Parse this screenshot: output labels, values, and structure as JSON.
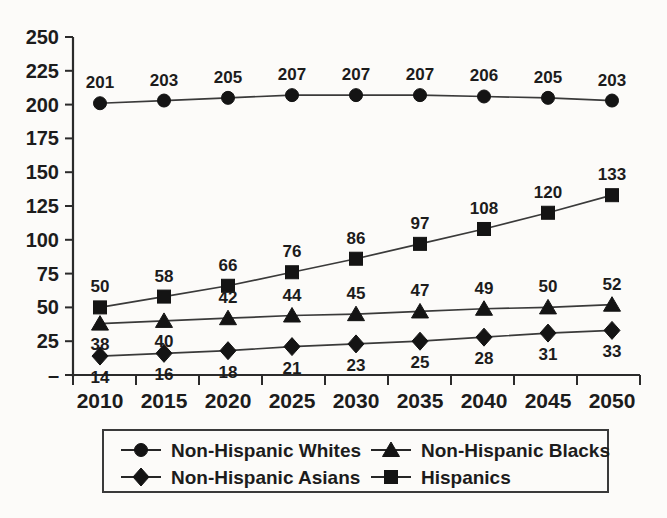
{
  "chart_data": {
    "type": "line",
    "title": "",
    "xlabel": "",
    "ylabel": "",
    "categories": [
      "2010",
      "2015",
      "2020",
      "2025",
      "2030",
      "2035",
      "2040",
      "2045",
      "2050"
    ],
    "ylim": [
      0,
      250
    ],
    "ytick_labels": [
      "–",
      "25",
      "50",
      "75",
      "100",
      "125",
      "150",
      "175",
      "200",
      "225",
      "250"
    ],
    "ytick_values": [
      0,
      25,
      50,
      75,
      100,
      125,
      150,
      175,
      200,
      225,
      250
    ],
    "grid": false,
    "legend_position": "bottom",
    "series": [
      {
        "name": "Non-Hispanic Whites",
        "marker": "circle",
        "values": [
          201,
          203,
          205,
          207,
          207,
          207,
          206,
          205,
          203
        ],
        "label_position": "above"
      },
      {
        "name": "Non-Hispanic Blacks",
        "marker": "triangle",
        "values": [
          38,
          40,
          42,
          44,
          45,
          47,
          49,
          50,
          52
        ],
        "label_position": "mixed"
      },
      {
        "name": "Non-Hispanic Asians",
        "marker": "diamond",
        "values": [
          14,
          16,
          18,
          21,
          23,
          25,
          28,
          31,
          33
        ],
        "label_position": "below"
      },
      {
        "name": "Hispanics",
        "marker": "square",
        "values": [
          50,
          58,
          66,
          76,
          86,
          97,
          108,
          120,
          133
        ],
        "label_position": "above"
      }
    ]
  },
  "legend": {
    "entries": [
      {
        "label": "Non-Hispanic Whites",
        "marker": "circle"
      },
      {
        "label": "Non-Hispanic Blacks",
        "marker": "triangle"
      },
      {
        "label": "Non-Hispanic Asians",
        "marker": "diamond"
      },
      {
        "label": "Hispanics",
        "marker": "square"
      }
    ]
  },
  "colors": {
    "ink": "#141414",
    "axis": "#2b2b2b",
    "line": "#3a3a3a",
    "background": "#fcfbf9"
  }
}
